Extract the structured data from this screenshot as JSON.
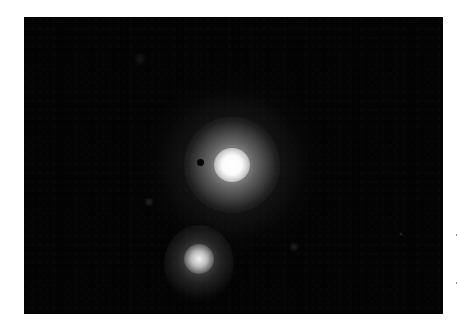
{
  "image": {
    "description": "Astronomical photograph of two glowing objects on a black background",
    "background_color": "#030303",
    "objects": [
      {
        "name": "primary-object",
        "cx": 208,
        "cy": 148,
        "core_radius": 16,
        "halo_radius": 70,
        "brightness": "#ffffff"
      },
      {
        "name": "secondary-object",
        "cx": 175,
        "cy": 241,
        "core_radius": 10,
        "halo_radius": 30,
        "brightness": "#d8d8d8"
      }
    ],
    "dark_spot": {
      "cx": 176,
      "cy": 146,
      "r": 3
    }
  }
}
